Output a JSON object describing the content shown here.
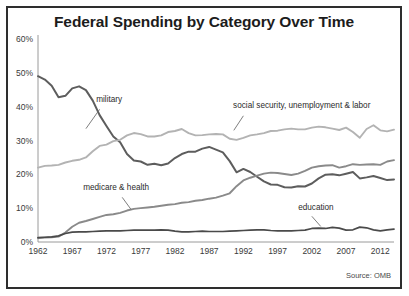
{
  "title": "Federal Spending by Category Over Time",
  "source": "Source: OMB",
  "colors": {
    "military": "#5d5d5d",
    "social_security": "#b3b3b3",
    "medicare": "#8a8a8a",
    "education": "#4a4a4a",
    "axis": "#9a9a9a",
    "frame": "#2e2e2e",
    "text": "#1c1c1c"
  },
  "labels": {
    "military": "military",
    "social_security": "social security, unemployment & labor",
    "medicare": "medicare & health",
    "education": "education"
  },
  "chart_data": {
    "type": "line",
    "title": "Federal Spending by Category Over Time",
    "xlabel": "",
    "ylabel": "",
    "xlim": [
      1962,
      2014
    ],
    "ylim": [
      0,
      60
    ],
    "grid": false,
    "legend": "inline-annotations",
    "source": "Source: OMB",
    "ytick_labels": [
      "0%",
      "10%",
      "20%",
      "30%",
      "40%",
      "50%",
      "60%"
    ],
    "ytick_values": [
      0,
      10,
      20,
      30,
      40,
      50,
      60
    ],
    "xtick_labels": [
      "1962",
      "1967",
      "1972",
      "1977",
      "1982",
      "1987",
      "1992",
      "1997",
      "2002",
      "2007",
      "2012"
    ],
    "xtick_values": [
      1962,
      1967,
      1972,
      1977,
      1982,
      1987,
      1992,
      1997,
      2002,
      2007,
      2012
    ],
    "x": [
      1962,
      1963,
      1964,
      1965,
      1966,
      1967,
      1968,
      1969,
      1970,
      1971,
      1972,
      1973,
      1974,
      1975,
      1976,
      1977,
      1978,
      1979,
      1980,
      1981,
      1982,
      1983,
      1984,
      1985,
      1986,
      1987,
      1988,
      1989,
      1990,
      1991,
      1992,
      1993,
      1994,
      1995,
      1996,
      1997,
      1998,
      1999,
      2000,
      2001,
      2002,
      2003,
      2004,
      2005,
      2006,
      2007,
      2008,
      2009,
      2010,
      2011,
      2012,
      2013,
      2014
    ],
    "series": [
      {
        "name": "military",
        "color": "#5d5d5d",
        "values": [
          49.0,
          48.0,
          46.2,
          42.8,
          43.2,
          45.4,
          46.0,
          44.9,
          41.8,
          37.5,
          34.3,
          31.2,
          29.5,
          26.0,
          24.1,
          23.8,
          22.8,
          23.1,
          22.7,
          23.2,
          24.8,
          26.0,
          26.7,
          26.7,
          27.6,
          28.1,
          27.3,
          26.5,
          23.9,
          20.6,
          21.6,
          20.7,
          19.3,
          17.9,
          17.0,
          16.9,
          16.2,
          16.1,
          16.5,
          16.4,
          17.3,
          18.8,
          19.9,
          20.0,
          19.7,
          20.2,
          20.7,
          18.8,
          19.1,
          19.5,
          18.9,
          18.3,
          18.5
        ]
      },
      {
        "name": "social security, unemployment & labor",
        "color": "#b3b3b3",
        "values": [
          22.0,
          22.5,
          22.6,
          22.8,
          23.5,
          24.0,
          24.3,
          25.0,
          26.8,
          28.4,
          28.8,
          29.8,
          30.2,
          31.5,
          32.2,
          31.9,
          31.2,
          31.2,
          31.5,
          32.5,
          32.8,
          33.4,
          32.2,
          31.5,
          31.6,
          31.8,
          31.9,
          31.8,
          30.5,
          30.2,
          30.8,
          31.5,
          31.8,
          32.2,
          32.8,
          32.9,
          33.3,
          33.5,
          33.3,
          33.3,
          33.8,
          34.1,
          33.9,
          33.5,
          33.1,
          33.8,
          32.5,
          30.8,
          33.4,
          34.5,
          33.0,
          32.7,
          33.2
        ]
      },
      {
        "name": "medicare & health",
        "color": "#8a8a8a",
        "values": [
          1.2,
          1.3,
          1.4,
          1.6,
          2.8,
          4.5,
          5.7,
          6.2,
          6.8,
          7.4,
          8.0,
          8.2,
          8.6,
          9.3,
          9.8,
          10.0,
          10.2,
          10.4,
          10.7,
          11.0,
          11.2,
          11.6,
          11.8,
          12.2,
          12.4,
          12.8,
          13.1,
          13.7,
          14.4,
          16.5,
          18.2,
          19.0,
          19.6,
          20.2,
          20.5,
          20.4,
          20.1,
          19.8,
          20.2,
          21.0,
          22.0,
          22.4,
          22.6,
          22.7,
          22.0,
          22.4,
          23.0,
          22.8,
          22.9,
          23.0,
          22.8,
          23.8,
          24.2
        ]
      },
      {
        "name": "education",
        "color": "#4a4a4a",
        "values": [
          1.3,
          1.4,
          1.5,
          1.8,
          2.5,
          2.9,
          3.0,
          3.0,
          3.1,
          3.2,
          3.3,
          3.3,
          3.3,
          3.4,
          3.5,
          3.5,
          3.5,
          3.5,
          3.6,
          3.5,
          3.2,
          3.0,
          3.0,
          3.1,
          3.2,
          3.1,
          3.1,
          3.1,
          3.2,
          3.3,
          3.4,
          3.5,
          3.6,
          3.6,
          3.4,
          3.3,
          3.3,
          3.3,
          3.4,
          3.5,
          4.0,
          4.1,
          4.0,
          4.3,
          4.1,
          3.5,
          3.6,
          4.4,
          4.2,
          3.6,
          3.3,
          3.6,
          3.8
        ]
      }
    ],
    "annotations": [
      {
        "text": "military",
        "x": 1970,
        "y": 41
      },
      {
        "text": "social security, unemployment & labor",
        "x": 1992,
        "y": 39
      },
      {
        "text": "medicare & health",
        "x": 1972,
        "y": 15
      },
      {
        "text": "education",
        "x": 2003,
        "y": 9
      }
    ]
  }
}
